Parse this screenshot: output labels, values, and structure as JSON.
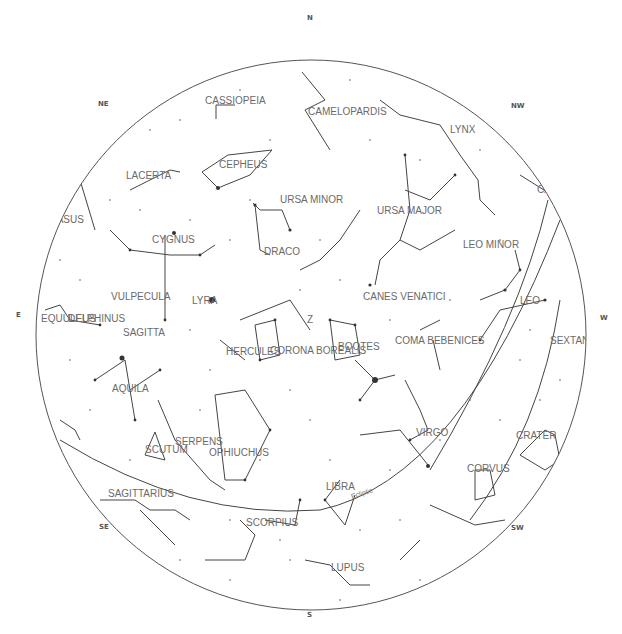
{
  "compass": [
    {
      "label": "N",
      "x": 310,
      "y": 19
    },
    {
      "label": "NE",
      "x": 103,
      "y": 105
    },
    {
      "label": "NW",
      "x": 517,
      "y": 107
    },
    {
      "label": "E",
      "x": 18,
      "y": 316
    },
    {
      "label": "W",
      "x": 603,
      "y": 318
    },
    {
      "label": "SE",
      "x": 104,
      "y": 528
    },
    {
      "label": "SW",
      "x": 517,
      "y": 529
    },
    {
      "label": "S",
      "x": 310,
      "y": 615
    }
  ],
  "ecliptic_label": "Ecliptic",
  "constellations": [
    {
      "name": "CASSIOPEIA",
      "x": 205,
      "y": 104
    },
    {
      "name": "CAMELOPARDIS",
      "x": 308,
      "y": 115
    },
    {
      "name": "LYNX",
      "x": 450,
      "y": 133
    },
    {
      "name": "CEPHEUS",
      "x": 219,
      "y": 168
    },
    {
      "name": "LACERTA",
      "x": 126,
      "y": 179
    },
    {
      "name": "CAN",
      "x": 537,
      "y": 193
    },
    {
      "name": "URSA MINOR",
      "x": 280,
      "y": 203
    },
    {
      "name": "URSA MAJOR",
      "x": 377,
      "y": 214
    },
    {
      "name": "SASUS",
      "x": 50,
      "y": 223
    },
    {
      "name": "CYGNUS",
      "x": 152,
      "y": 243
    },
    {
      "name": "LEO MINOR",
      "x": 463,
      "y": 248
    },
    {
      "name": "DRACO",
      "x": 264,
      "y": 255
    },
    {
      "name": "CANES VENATICI",
      "x": 363,
      "y": 300
    },
    {
      "name": "VULPECULA",
      "x": 111,
      "y": 300
    },
    {
      "name": "LYRA",
      "x": 192,
      "y": 304
    },
    {
      "name": "LEO",
      "x": 520,
      "y": 304
    },
    {
      "name": "EQUULEUS",
      "x": 41,
      "y": 322
    },
    {
      "name": "DELPHINUS",
      "x": 68,
      "y": 322
    },
    {
      "name": "Z",
      "x": 307,
      "y": 323
    },
    {
      "name": "SAGITTA",
      "x": 123,
      "y": 336
    },
    {
      "name": "COMA BEBENICES",
      "x": 395,
      "y": 344
    },
    {
      "name": "SEXTAN",
      "x": 550,
      "y": 344
    },
    {
      "name": "BOOTES",
      "x": 338,
      "y": 350
    },
    {
      "name": "HERCULES",
      "x": 226,
      "y": 355
    },
    {
      "name": "CORONA BOREALIS",
      "x": 270,
      "y": 354
    },
    {
      "name": "AQUILA",
      "x": 112,
      "y": 392
    },
    {
      "name": "VIRGO",
      "x": 416,
      "y": 436
    },
    {
      "name": "CRATER",
      "x": 516,
      "y": 439
    },
    {
      "name": "SERPENS",
      "x": 175,
      "y": 445
    },
    {
      "name": "SCUTUM",
      "x": 145,
      "y": 453
    },
    {
      "name": "OPHIUCHUS",
      "x": 209,
      "y": 456
    },
    {
      "name": "CORVUS",
      "x": 467,
      "y": 472
    },
    {
      "name": "LIBRA",
      "x": 326,
      "y": 490
    },
    {
      "name": "SAGITTARIUS",
      "x": 108,
      "y": 497
    },
    {
      "name": "SCORPIUS",
      "x": 246,
      "y": 526
    },
    {
      "name": "LUPUS",
      "x": 331,
      "y": 571
    }
  ]
}
